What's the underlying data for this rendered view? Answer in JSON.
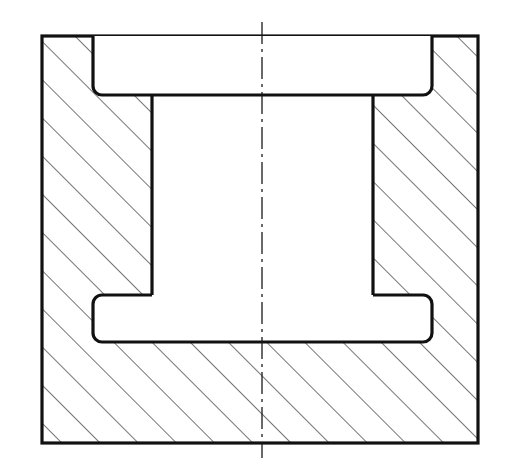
{
  "document": {
    "type": "engineering-drawing",
    "view_name": "Full Section View",
    "subject": "Bushing / sleeve bearing housing block",
    "projection": "orthographic-section",
    "background_color": "#ffffff",
    "line_color": "#111111",
    "hatch_color": "#3a3a3a"
  },
  "canvas": {
    "width": 509,
    "height": 476
  },
  "geometry": {
    "outer_block": {
      "name": "Outer body outline",
      "x_left": 42,
      "x_right": 478,
      "y_top": 36,
      "y_bottom": 443,
      "stroke_width": 3.2,
      "corner_radius": 0
    },
    "counterbore": {
      "name": "Upper counterbore recess",
      "x_left": 93,
      "x_right": 432,
      "y_top": 36,
      "y_bottom": 95,
      "corner_radius": 9,
      "stroke_width": 3.2
    },
    "central_bore": {
      "name": "Central through bore",
      "x_left": 152,
      "x_right": 373,
      "y_top": 95,
      "y_bottom": 295,
      "stroke_width": 3.2
    },
    "lower_groove": {
      "name": "Lower relief groove",
      "x_left": 93,
      "x_right": 432,
      "y_top": 295,
      "y_bottom": 342,
      "corner_radius": 9,
      "stroke_width": 3.2
    },
    "centerline": {
      "name": "Vertical axis of symmetry",
      "x": 262,
      "y_top": 22,
      "y_bottom": 458,
      "stroke_width": 1.3,
      "dash_pattern": "22 5 3 5"
    }
  },
  "hatching": {
    "name": "Section hatch (ISO 128 cross-section fill)",
    "angle_degrees": 45,
    "direction": "up-right",
    "spacing_px": 27,
    "stroke_width": 1.4,
    "color": "#3a3a3a",
    "regions": [
      {
        "label": "left-wall",
        "description": "Left vertical wall of block"
      },
      {
        "label": "right-wall",
        "description": "Right vertical wall of block"
      },
      {
        "label": "base",
        "description": "Lower base slab of block"
      }
    ]
  },
  "labels": {
    "title": "",
    "scale": "",
    "notes": ""
  }
}
